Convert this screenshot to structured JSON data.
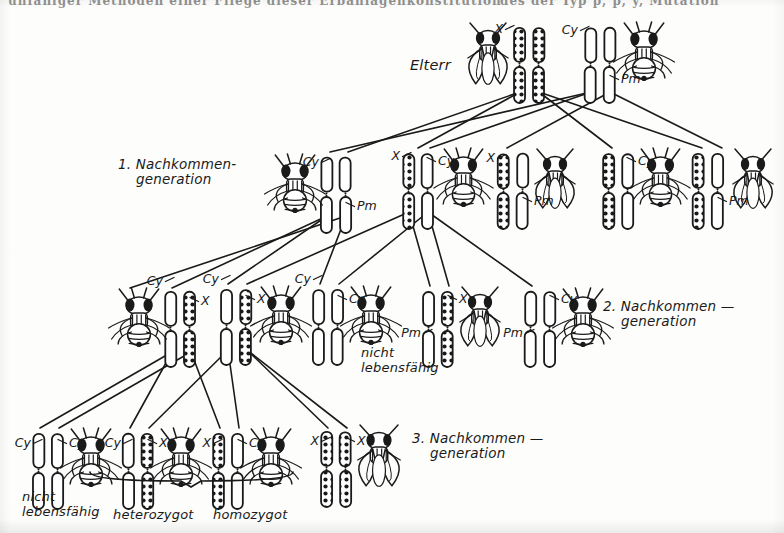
{
  "figure": {
    "kind": "genetics-breeding-scheme",
    "organism": "Drosophila",
    "background_color": "#fdfdfb",
    "ink_color": "#1a1a1a",
    "top_cut_text_left": "unfähiger Methoden einer Fliege dieser Erbanlagenkonstitution",
    "top_cut_text_right": "des der Typ p, p, y, Mutation"
  },
  "generation_labels": [
    {
      "id": "parents",
      "text": "Elterr",
      "line2": "",
      "x": 410,
      "y": 57,
      "size": 14.5
    },
    {
      "id": "gen1",
      "text": "1. Nachkommen-",
      "line2": "generation",
      "x": 118,
      "y": 157,
      "size": 13.5
    },
    {
      "id": "gen2",
      "text": "2. Nachkommen —",
      "line2": "generation",
      "x": 603,
      "y": 299,
      "size": 13.5
    },
    {
      "id": "gen3",
      "text": "3. Nachkommen —",
      "line2": "generation",
      "x": 412,
      "y": 431,
      "size": 13.5
    }
  ],
  "annotations": [
    {
      "id": "nicht-lebensfaehig-gen2",
      "line1": "nicht",
      "line2": "lebensfähig",
      "x": 361,
      "y": 346
    },
    {
      "id": "nicht-lebensfaehig-gen3",
      "line1": "nicht",
      "line2": "lebensfähig",
      "x": 22,
      "y": 490
    },
    {
      "id": "heterozygot",
      "line1": "heterozygot",
      "line2": "",
      "x": 113,
      "y": 508
    },
    {
      "id": "homozygot",
      "line1": "homozygot",
      "line2": "",
      "x": 213,
      "y": 508
    }
  ],
  "brace": {
    "id": "heterozygot-brace",
    "x1": 90,
    "x2": 293,
    "y": 472,
    "tip_y": 487,
    "mid_x": 191
  },
  "chromosome_types": {
    "X": {
      "label": "X",
      "fill": "hatched",
      "desc": "hatched/beaded X chromosome"
    },
    "Cy": {
      "label": "Cy",
      "fill": "plain",
      "desc": "plain white Curly balancer"
    },
    "Pm": {
      "label": "Pm",
      "fill": "plain",
      "desc": "plain white Plum balancer"
    }
  },
  "groups": [
    {
      "id": "p-female",
      "generation": "parents",
      "x": 470,
      "y": 26,
      "fly": {
        "side": "left",
        "view": "dorsal-winged",
        "x": 470,
        "y": 28,
        "w": 36,
        "h": 58
      },
      "chroms": [
        {
          "type": "X",
          "x": 514,
          "y": 28
        },
        {
          "type": "X",
          "x": 533,
          "y": 28
        }
      ],
      "tags": [
        {
          "text": "X",
          "x": 503,
          "y": 33,
          "anchor": "end"
        }
      ]
    },
    {
      "id": "p-male",
      "generation": "parents",
      "x": 580,
      "y": 26,
      "fly": {
        "side": "right",
        "view": "ventral",
        "x": 625,
        "y": 28,
        "w": 38,
        "h": 52
      },
      "chroms": [
        {
          "type": "Cy",
          "x": 585,
          "y": 28
        },
        {
          "type": "Pm",
          "x": 604,
          "y": 28
        }
      ],
      "tags": [
        {
          "text": "Cy",
          "x": 578,
          "y": 34,
          "anchor": "end"
        },
        {
          "text": "Pm",
          "x": 621,
          "y": 83,
          "anchor": "start"
        }
      ]
    },
    {
      "id": "g1-a",
      "generation": "gen1",
      "x": 275,
      "y": 158,
      "fly": {
        "side": "left",
        "view": "ventral",
        "x": 276,
        "y": 160,
        "w": 38,
        "h": 52
      },
      "chroms": [
        {
          "type": "Cy",
          "x": 321,
          "y": 158
        },
        {
          "type": "Pm",
          "x": 340,
          "y": 158
        }
      ],
      "tags": [
        {
          "text": "Cy",
          "x": 319,
          "y": 166,
          "anchor": "end"
        },
        {
          "text": "Pm",
          "x": 357,
          "y": 210,
          "anchor": "start"
        }
      ]
    },
    {
      "id": "g1-b",
      "generation": "gen1",
      "x": 400,
      "y": 152,
      "fly": {
        "side": "right",
        "view": "ventral",
        "x": 445,
        "y": 154,
        "w": 37,
        "h": 52
      },
      "chroms": [
        {
          "type": "X",
          "x": 403,
          "y": 154
        },
        {
          "type": "Cy",
          "x": 422,
          "y": 154
        }
      ],
      "tags": [
        {
          "text": "X",
          "x": 400,
          "y": 160,
          "anchor": "end"
        },
        {
          "text": "Cy",
          "x": 438,
          "y": 165,
          "anchor": "start"
        }
      ]
    },
    {
      "id": "g1-c",
      "generation": "gen1",
      "x": 495,
      "y": 152,
      "fly": {
        "side": "right",
        "view": "dorsal-winged",
        "x": 537,
        "y": 154,
        "w": 36,
        "h": 56
      },
      "chroms": [
        {
          "type": "X",
          "x": 498,
          "y": 154
        },
        {
          "type": "Pm",
          "x": 517,
          "y": 154
        }
      ],
      "tags": [
        {
          "text": "X",
          "x": 495,
          "y": 162,
          "anchor": "end"
        },
        {
          "text": "Pm",
          "x": 534,
          "y": 205,
          "anchor": "start"
        }
      ]
    },
    {
      "id": "g1-d",
      "generation": "gen1",
      "x": 600,
      "y": 152,
      "fly": {
        "side": "right",
        "view": "ventral",
        "x": 642,
        "y": 154,
        "w": 37,
        "h": 52
      },
      "chroms": [
        {
          "type": "X",
          "x": 603,
          "y": 154
        },
        {
          "type": "Cy",
          "x": 622,
          "y": 154
        }
      ],
      "tags": [
        {
          "text": "Cy",
          "x": 638,
          "y": 165,
          "anchor": "start"
        }
      ]
    },
    {
      "id": "g1-e",
      "generation": "gen1",
      "x": 690,
      "y": 152,
      "fly": {
        "side": "right",
        "view": "dorsal-winged",
        "x": 735,
        "y": 154,
        "w": 36,
        "h": 56
      },
      "chroms": [
        {
          "type": "X",
          "x": 693,
          "y": 154
        },
        {
          "type": "Pm",
          "x": 712,
          "y": 154
        }
      ],
      "tags": [
        {
          "text": "Pm",
          "x": 729,
          "y": 205,
          "anchor": "start"
        }
      ]
    },
    {
      "id": "g2-a",
      "generation": "gen2",
      "x": 120,
      "y": 292,
      "fly": {
        "side": "left",
        "view": "ventral",
        "x": 120,
        "y": 294,
        "w": 38,
        "h": 52
      },
      "chroms": [
        {
          "type": "Cy",
          "x": 165,
          "y": 292
        },
        {
          "type": "X",
          "x": 184,
          "y": 292
        }
      ],
      "tags": [
        {
          "text": "Cy",
          "x": 163,
          "y": 285,
          "anchor": "end"
        },
        {
          "text": "X",
          "x": 201,
          "y": 305,
          "anchor": "start"
        }
      ]
    },
    {
      "id": "g2-b",
      "generation": "gen2",
      "x": 218,
      "y": 288,
      "fly": {
        "side": "right",
        "view": "ventral",
        "x": 262,
        "y": 292,
        "w": 38,
        "h": 52
      },
      "chroms": [
        {
          "type": "Cy",
          "x": 221,
          "y": 290
        },
        {
          "type": "X",
          "x": 240,
          "y": 290
        }
      ],
      "tags": [
        {
          "text": "Cy",
          "x": 219,
          "y": 283,
          "anchor": "end"
        },
        {
          "text": "X",
          "x": 257,
          "y": 303,
          "anchor": "start"
        }
      ]
    },
    {
      "id": "g2-c",
      "generation": "gen2",
      "x": 310,
      "y": 288,
      "fly": {
        "side": "right",
        "view": "ventral",
        "x": 352,
        "y": 292,
        "w": 38,
        "h": 52
      },
      "chroms": [
        {
          "type": "Cy",
          "x": 313,
          "y": 290
        },
        {
          "type": "Cy",
          "x": 332,
          "y": 290
        }
      ],
      "tags": [
        {
          "text": "Cy",
          "x": 311,
          "y": 283,
          "anchor": "end"
        },
        {
          "text": "Cy",
          "x": 349,
          "y": 303,
          "anchor": "start"
        }
      ]
    },
    {
      "id": "g2-d",
      "generation": "gen2",
      "x": 420,
      "y": 290,
      "fly": {
        "side": "right",
        "view": "dorsal-winged",
        "x": 462,
        "y": 292,
        "w": 36,
        "h": 56
      },
      "chroms": [
        {
          "type": "Pm",
          "x": 423,
          "y": 292
        },
        {
          "type": "X",
          "x": 442,
          "y": 292
        }
      ],
      "tags": [
        {
          "text": "Pm",
          "x": 421,
          "y": 337,
          "anchor": "end"
        },
        {
          "text": "X",
          "x": 459,
          "y": 303,
          "anchor": "start"
        }
      ]
    },
    {
      "id": "g2-e",
      "generation": "gen2",
      "x": 522,
      "y": 290,
      "fly": {
        "side": "right",
        "view": "ventral",
        "x": 564,
        "y": 294,
        "w": 38,
        "h": 52
      },
      "chroms": [
        {
          "type": "Pm",
          "x": 525,
          "y": 292
        },
        {
          "type": "Cy",
          "x": 544,
          "y": 292
        }
      ],
      "tags": [
        {
          "text": "Pm",
          "x": 523,
          "y": 337,
          "anchor": "end"
        },
        {
          "text": "Cy",
          "x": 561,
          "y": 303,
          "anchor": "start"
        }
      ]
    },
    {
      "id": "g3-a",
      "generation": "gen3",
      "x": 30,
      "y": 432,
      "fly": {
        "side": "right",
        "view": "ventral",
        "x": 72,
        "y": 434,
        "w": 38,
        "h": 52
      },
      "chroms": [
        {
          "type": "Cy",
          "x": 33,
          "y": 434
        },
        {
          "type": "Cy",
          "x": 52,
          "y": 434
        }
      ],
      "tags": [
        {
          "text": "Cy",
          "x": 31,
          "y": 447,
          "anchor": "end"
        },
        {
          "text": "Cy",
          "x": 69,
          "y": 447,
          "anchor": "start"
        }
      ]
    },
    {
      "id": "g3-b",
      "generation": "gen3",
      "x": 120,
      "y": 432,
      "fly": {
        "side": "right",
        "view": "ventral",
        "x": 162,
        "y": 434,
        "w": 38,
        "h": 52
      },
      "chroms": [
        {
          "type": "Cy",
          "x": 123,
          "y": 434
        },
        {
          "type": "X",
          "x": 142,
          "y": 434
        }
      ],
      "tags": [
        {
          "text": "Cy",
          "x": 121,
          "y": 447,
          "anchor": "end"
        },
        {
          "text": "X",
          "x": 159,
          "y": 447,
          "anchor": "start"
        }
      ]
    },
    {
      "id": "g3-c",
      "generation": "gen3",
      "x": 210,
      "y": 432,
      "fly": {
        "side": "right",
        "view": "ventral",
        "x": 252,
        "y": 434,
        "w": 38,
        "h": 52
      },
      "chroms": [
        {
          "type": "X",
          "x": 213,
          "y": 434
        },
        {
          "type": "Cy",
          "x": 232,
          "y": 434
        }
      ],
      "tags": [
        {
          "text": "X",
          "x": 211,
          "y": 447,
          "anchor": "end"
        },
        {
          "text": "Cy",
          "x": 249,
          "y": 447,
          "anchor": "start"
        }
      ]
    },
    {
      "id": "g3-d",
      "generation": "gen3",
      "x": 318,
      "y": 430,
      "fly": {
        "side": "right",
        "view": "dorsal-winged",
        "x": 360,
        "y": 430,
        "w": 38,
        "h": 58
      },
      "chroms": [
        {
          "type": "X",
          "x": 321,
          "y": 432
        },
        {
          "type": "X",
          "x": 340,
          "y": 432
        }
      ],
      "tags": [
        {
          "text": "X",
          "x": 319,
          "y": 445,
          "anchor": "end"
        },
        {
          "text": "X",
          "x": 357,
          "y": 445,
          "anchor": "start"
        }
      ]
    }
  ],
  "cross_lines": [
    {
      "x1": 520,
      "y1": 92,
      "x2": 348,
      "y2": 152
    },
    {
      "x1": 520,
      "y1": 92,
      "x2": 418,
      "y2": 148
    },
    {
      "x1": 539,
      "y1": 92,
      "x2": 612,
      "y2": 148
    },
    {
      "x1": 539,
      "y1": 92,
      "x2": 702,
      "y2": 148
    },
    {
      "x1": 591,
      "y1": 92,
      "x2": 330,
      "y2": 152
    },
    {
      "x1": 591,
      "y1": 92,
      "x2": 430,
      "y2": 148
    },
    {
      "x1": 610,
      "y1": 92,
      "x2": 507,
      "y2": 148
    },
    {
      "x1": 610,
      "y1": 92,
      "x2": 722,
      "y2": 148
    },
    {
      "x1": 327,
      "y1": 216,
      "x2": 172,
      "y2": 288
    },
    {
      "x1": 327,
      "y1": 216,
      "x2": 228,
      "y2": 284
    },
    {
      "x1": 346,
      "y1": 216,
      "x2": 130,
      "y2": 288
    },
    {
      "x1": 346,
      "y1": 216,
      "x2": 320,
      "y2": 284
    },
    {
      "x1": 409,
      "y1": 212,
      "x2": 247,
      "y2": 284
    },
    {
      "x1": 409,
      "y1": 212,
      "x2": 430,
      "y2": 286
    },
    {
      "x1": 428,
      "y1": 212,
      "x2": 339,
      "y2": 284
    },
    {
      "x1": 428,
      "y1": 212,
      "x2": 532,
      "y2": 286
    },
    {
      "x1": 428,
      "y1": 212,
      "x2": 449,
      "y2": 286
    },
    {
      "x1": 172,
      "y1": 352,
      "x2": 40,
      "y2": 428
    },
    {
      "x1": 172,
      "y1": 352,
      "x2": 130,
      "y2": 428
    },
    {
      "x1": 191,
      "y1": 352,
      "x2": 59,
      "y2": 428
    },
    {
      "x1": 191,
      "y1": 352,
      "x2": 220,
      "y2": 428
    },
    {
      "x1": 228,
      "y1": 350,
      "x2": 149,
      "y2": 428
    },
    {
      "x1": 228,
      "y1": 350,
      "x2": 239,
      "y2": 428
    },
    {
      "x1": 247,
      "y1": 350,
      "x2": 328,
      "y2": 428
    },
    {
      "x1": 247,
      "y1": 350,
      "x2": 347,
      "y2": 428
    }
  ]
}
